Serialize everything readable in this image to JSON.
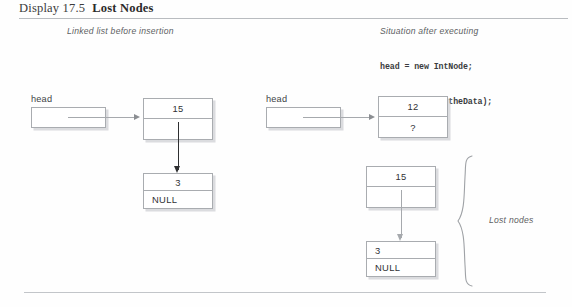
{
  "header": {
    "display_label": "Display 17.5",
    "display_name": "Lost Nodes"
  },
  "captions": {
    "left": "Linked list before insertion",
    "right": "Situation after executing"
  },
  "code": {
    "line1": "head = new IntNode;",
    "line2": "head->setData(theData);"
  },
  "left_diagram": {
    "head_label": "head",
    "node1": {
      "data": "15",
      "link": ""
    },
    "node2": {
      "data": "3",
      "link": "NULL"
    }
  },
  "right_diagram": {
    "head_label": "head",
    "node1": {
      "data": "12",
      "link": "?"
    }
  },
  "lost_nodes": {
    "label": "Lost nodes",
    "node1": {
      "data": "15",
      "link": ""
    },
    "node2": {
      "data": "3",
      "link": "NULL"
    }
  },
  "colors": {
    "rule": "#b9bcc0",
    "box_border": "#a9acb0",
    "connector": "#a6a9ad",
    "dark_arrow": "#2e2f31",
    "caption_text": "#5d5f63",
    "body_text": "#303235"
  }
}
